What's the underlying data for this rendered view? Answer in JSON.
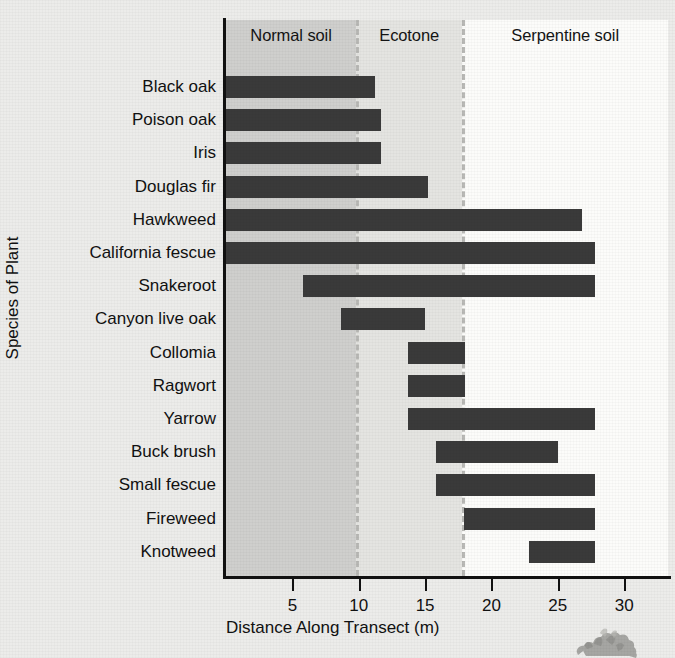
{
  "chart_data": {
    "type": "bar",
    "orientation": "horizontal",
    "title": "",
    "xlabel": "Distance Along Transect (m)",
    "ylabel": "Species of Plant",
    "xlim": [
      0,
      33.3
    ],
    "xticks": [
      5,
      10,
      15,
      20,
      25,
      30
    ],
    "xtick_labels": [
      "5",
      "10",
      "15",
      "20",
      "25",
      "30"
    ],
    "grid": false,
    "legend": "none",
    "bar_color": "#3a3a3a",
    "categories": [
      "Black oak",
      "Poison oak",
      "Iris",
      "Douglas fir",
      "Hawkweed",
      "California fescue",
      "Snakeroot",
      "Canyon live oak",
      "Collomia",
      "Ragwort",
      "Yarrow",
      "Buck brush",
      "Small fescue",
      "Fireweed",
      "Knotweed"
    ],
    "ranges": [
      {
        "species": "Black oak",
        "start": 0.0,
        "end": 11.2
      },
      {
        "species": "Poison oak",
        "start": 0.0,
        "end": 11.7
      },
      {
        "species": "Iris",
        "start": 0.0,
        "end": 11.7
      },
      {
        "species": "Douglas fir",
        "start": 0.0,
        "end": 15.2
      },
      {
        "species": "Hawkweed",
        "start": 0.0,
        "end": 26.8
      },
      {
        "species": "California fescue",
        "start": 0.0,
        "end": 27.8
      },
      {
        "species": "Snakeroot",
        "start": 5.8,
        "end": 27.8
      },
      {
        "species": "Canyon live oak",
        "start": 8.7,
        "end": 15.0
      },
      {
        "species": "Collomia",
        "start": 13.7,
        "end": 18.0
      },
      {
        "species": "Ragwort",
        "start": 13.7,
        "end": 18.0
      },
      {
        "species": "Yarrow",
        "start": 13.7,
        "end": 27.8
      },
      {
        "species": "Buck brush",
        "start": 15.8,
        "end": 25.0
      },
      {
        "species": "Small fescue",
        "start": 15.8,
        "end": 27.8
      },
      {
        "species": "Fireweed",
        "start": 17.9,
        "end": 27.8
      },
      {
        "species": "Knotweed",
        "start": 22.8,
        "end": 27.8
      }
    ],
    "zones": [
      {
        "name": "Normal soil",
        "start": 0.0,
        "end": 9.8,
        "color": "#cfcfcd"
      },
      {
        "name": "Ecotone",
        "start": 9.8,
        "end": 17.8,
        "color": "#e4e4e1"
      },
      {
        "name": "Serpentine soil",
        "start": 17.8,
        "end": 33.3,
        "color": "#fcfcfa"
      }
    ],
    "zone_dividers": [
      9.8,
      17.8
    ]
  },
  "decoration": {
    "plant_sprite": "plant-sprite-icon"
  }
}
